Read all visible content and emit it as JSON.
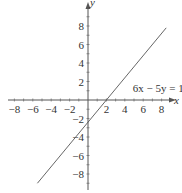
{
  "chart_data": {
    "type": "line",
    "title": "",
    "xlabel": "x",
    "ylabel": "y",
    "xlim": [
      -8.5,
      8.5
    ],
    "ylim": [
      -9.5,
      9.5
    ],
    "grid": false,
    "x_ticks": [
      -8,
      -6,
      -4,
      -2,
      2,
      4,
      6,
      8
    ],
    "y_ticks": [
      -8,
      -6,
      -4,
      -2,
      2,
      4,
      6,
      8
    ],
    "x_tick_labels": [
      "−8",
      "−6",
      "−4",
      "−2",
      "2",
      "4",
      "6",
      "8"
    ],
    "y_tick_labels": [
      "8",
      "6",
      "4",
      "2",
      "−2",
      "−4",
      "−6",
      "−8"
    ],
    "series": [
      {
        "name": "6x − 5y = 12",
        "equation": "y = 1.2x − 2.4",
        "x": [
          -5.5,
          8.5
        ],
        "y": [
          -9.0,
          7.8
        ],
        "color": "#555555"
      }
    ],
    "annotations": [
      {
        "text": "6x − 5y = 12",
        "x": 5.3,
        "y": 1.3
      }
    ]
  },
  "labels": {
    "x_axis": "x",
    "y_axis": "y",
    "equation": "6x − 5y = 12"
  }
}
